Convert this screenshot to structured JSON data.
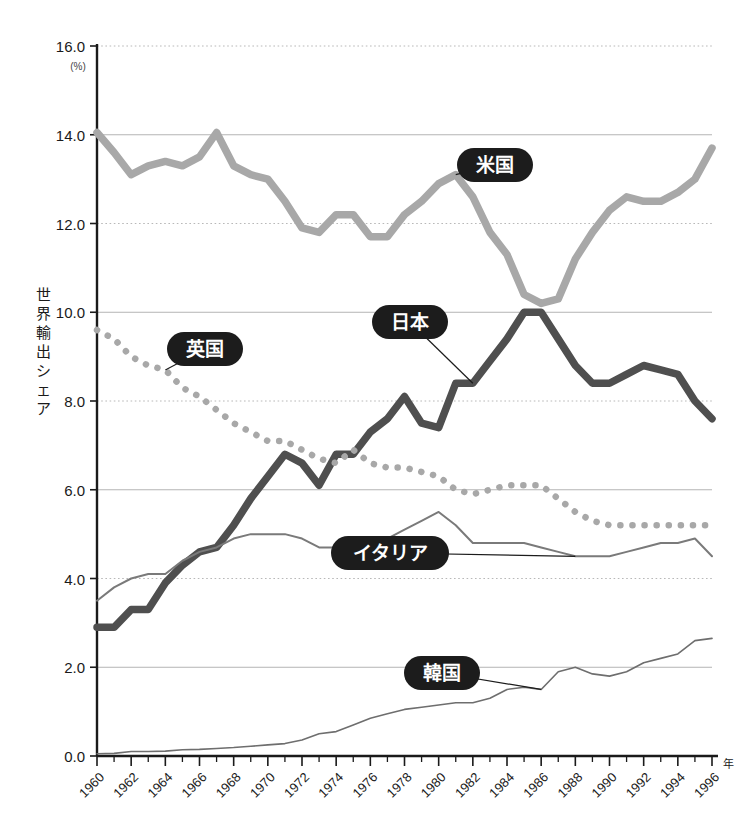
{
  "chart_data": {
    "type": "line",
    "title": "",
    "xlabel": "年",
    "ylabel": "世界輸出シェア",
    "unit_note": "(%)",
    "xlim": [
      1960,
      1996
    ],
    "ylim": [
      0.0,
      16.0
    ],
    "grid": true,
    "legend": "inline-labels",
    "y_ticks": [
      "0.0",
      "2.0",
      "4.0",
      "6.0",
      "8.0",
      "10.0",
      "12.0",
      "14.0",
      "16.0"
    ],
    "y_tick_values": [
      0.0,
      2.0,
      4.0,
      6.0,
      8.0,
      10.0,
      12.0,
      14.0,
      16.0
    ],
    "x_ticks": [
      "1960",
      "1962",
      "1964",
      "1966",
      "1968",
      "1970",
      "1972",
      "1974",
      "1976",
      "1978",
      "1980",
      "1982",
      "1984",
      "1986",
      "1988",
      "1990",
      "1992",
      "1994",
      "1996"
    ],
    "x_tick_values": [
      1960,
      1962,
      1964,
      1966,
      1968,
      1970,
      1972,
      1974,
      1976,
      1978,
      1980,
      1982,
      1984,
      1986,
      1988,
      1990,
      1992,
      1994,
      1996
    ],
    "x": [
      1960,
      1961,
      1962,
      1963,
      1964,
      1965,
      1966,
      1967,
      1968,
      1969,
      1970,
      1971,
      1972,
      1973,
      1974,
      1975,
      1976,
      1977,
      1978,
      1979,
      1980,
      1981,
      1982,
      1983,
      1984,
      1985,
      1986,
      1987,
      1988,
      1989,
      1990,
      1991,
      1992,
      1993,
      1994,
      1995,
      1996
    ],
    "series": [
      {
        "name": "米国",
        "name_en": "United States",
        "style": "thick-solid",
        "color": "#a8a8a8",
        "values": [
          14.05,
          13.6,
          13.1,
          13.3,
          13.4,
          13.3,
          13.5,
          14.05,
          13.3,
          13.1,
          13.0,
          12.5,
          11.9,
          11.8,
          12.2,
          12.2,
          11.7,
          11.7,
          12.2,
          12.5,
          12.9,
          13.1,
          12.6,
          11.8,
          11.3,
          10.4,
          10.2,
          10.3,
          11.2,
          11.8,
          12.3,
          12.6,
          12.5,
          12.5,
          12.7,
          13.0,
          13.7
        ]
      },
      {
        "name": "日本",
        "name_en": "Japan",
        "style": "thick-solid-dark",
        "color": "#4f4f4f",
        "values": [
          2.9,
          2.9,
          3.3,
          3.3,
          3.9,
          4.3,
          4.6,
          4.7,
          5.2,
          5.8,
          6.3,
          6.8,
          6.6,
          6.1,
          6.8,
          6.8,
          7.3,
          7.6,
          8.1,
          7.5,
          7.4,
          8.4,
          8.4,
          8.9,
          9.4,
          10.0,
          10.0,
          9.4,
          8.8,
          8.4,
          8.4,
          8.6,
          8.8,
          8.7,
          8.6,
          8.0,
          7.6
        ]
      },
      {
        "name": "英国",
        "name_en": "United Kingdom",
        "style": "dotted",
        "color": "#a8a8a8",
        "values": [
          9.6,
          9.4,
          9.0,
          8.8,
          8.7,
          8.3,
          8.1,
          7.8,
          7.5,
          7.3,
          7.1,
          7.1,
          6.9,
          6.7,
          6.6,
          6.9,
          6.6,
          6.5,
          6.5,
          6.4,
          6.3,
          6.0,
          5.9,
          6.0,
          6.1,
          6.1,
          6.1,
          5.8,
          5.5,
          5.3,
          5.2,
          5.2,
          5.2,
          5.2,
          5.2,
          5.2,
          5.2
        ]
      },
      {
        "name": "イタリア",
        "name_en": "Italy",
        "style": "thin-solid",
        "color": "#7a7a7a",
        "values": [
          3.5,
          3.8,
          4.0,
          4.1,
          4.1,
          4.4,
          4.6,
          4.7,
          4.9,
          5.0,
          5.0,
          5.0,
          4.9,
          4.7,
          4.7,
          4.7,
          4.7,
          4.9,
          5.1,
          5.3,
          5.5,
          5.2,
          4.8,
          4.8,
          4.8,
          4.8,
          4.7,
          4.6,
          4.5,
          4.5,
          4.5,
          4.6,
          4.7,
          4.8,
          4.8,
          4.9,
          4.5
        ]
      },
      {
        "name": "韓国",
        "name_en": "South Korea",
        "style": "thin-solid-light",
        "color": "#6e6e6e",
        "values": [
          0.05,
          0.06,
          0.1,
          0.1,
          0.11,
          0.14,
          0.15,
          0.17,
          0.19,
          0.22,
          0.25,
          0.28,
          0.36,
          0.5,
          0.55,
          0.7,
          0.85,
          0.95,
          1.05,
          1.1,
          1.15,
          1.2,
          1.2,
          1.3,
          1.5,
          1.55,
          1.5,
          1.9,
          2.0,
          1.85,
          1.8,
          1.9,
          2.1,
          2.2,
          2.3,
          2.6,
          2.65
        ]
      }
    ],
    "annotations": [
      {
        "label": "米国",
        "x": 1981,
        "y": 13.1,
        "badge_cx": 495,
        "badge_cy": 165
      },
      {
        "label": "日本",
        "x": 1982,
        "y": 8.4,
        "badge_cx": 410,
        "badge_cy": 322
      },
      {
        "label": "英国",
        "x": 1964,
        "y": 8.7,
        "badge_cx": 205,
        "badge_cy": 349
      },
      {
        "label": "イタリア",
        "x": 1988,
        "y": 4.5,
        "badge_cx": 390,
        "badge_cy": 553
      },
      {
        "label": "韓国",
        "x": 1986,
        "y": 1.5,
        "badge_cx": 442,
        "badge_cy": 673
      }
    ]
  },
  "colors": {
    "usa": "#a8a8a8",
    "japan": "#4f4f4f",
    "uk": "#a8a8a8",
    "italy": "#7a7a7a",
    "korea": "#6e6e6e",
    "axis": "#1a1a1a",
    "grid": "#b4b4b4",
    "badge": "#1c1c1c",
    "background": "#ffffff"
  }
}
